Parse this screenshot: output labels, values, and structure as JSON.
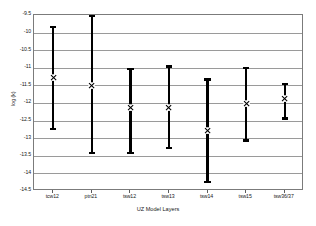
{
  "chart_data": {
    "type": "scatter",
    "title": "",
    "xlabel": "UZ Model Layers",
    "ylabel": "log (k)",
    "ylim": [
      -14.5,
      -9.5
    ],
    "ytick_labels": [
      "-9.5",
      "-10",
      "-10.5",
      "-11",
      "-11.5",
      "-12",
      "-12.5",
      "-13",
      "-13.5",
      "-14",
      "-14.5"
    ],
    "ytick_values": [
      -9.5,
      -10,
      -10.5,
      -11,
      -11.5,
      -12,
      -12.5,
      -13,
      -13.5,
      -14,
      -14.5
    ],
    "grid": true,
    "legend": "none",
    "categories": [
      "tcw12",
      "ptn21",
      "tsw12",
      "tsw13",
      "tsw14",
      "tsw15",
      "tsw36/37"
    ],
    "series": [
      {
        "name": "log (k) mean with range",
        "marker": "x-cross",
        "values": [
          -11.28,
          -11.5,
          -12.12,
          -12.13,
          -12.78,
          -12.03,
          -11.88
        ],
        "upper": [
          -9.8,
          -9.5,
          -11.0,
          -10.93,
          -11.3,
          -10.98,
          -11.42
        ],
        "lower": [
          -12.78,
          -13.45,
          -13.45,
          -13.32,
          -14.27,
          -13.1,
          -12.48
        ]
      }
    ],
    "colors": {
      "series": "#000000",
      "gridline": "#9a9a9a",
      "axis_border": "#7b7b7b",
      "background": "#ffffff",
      "text": "#1a1a1a"
    }
  }
}
